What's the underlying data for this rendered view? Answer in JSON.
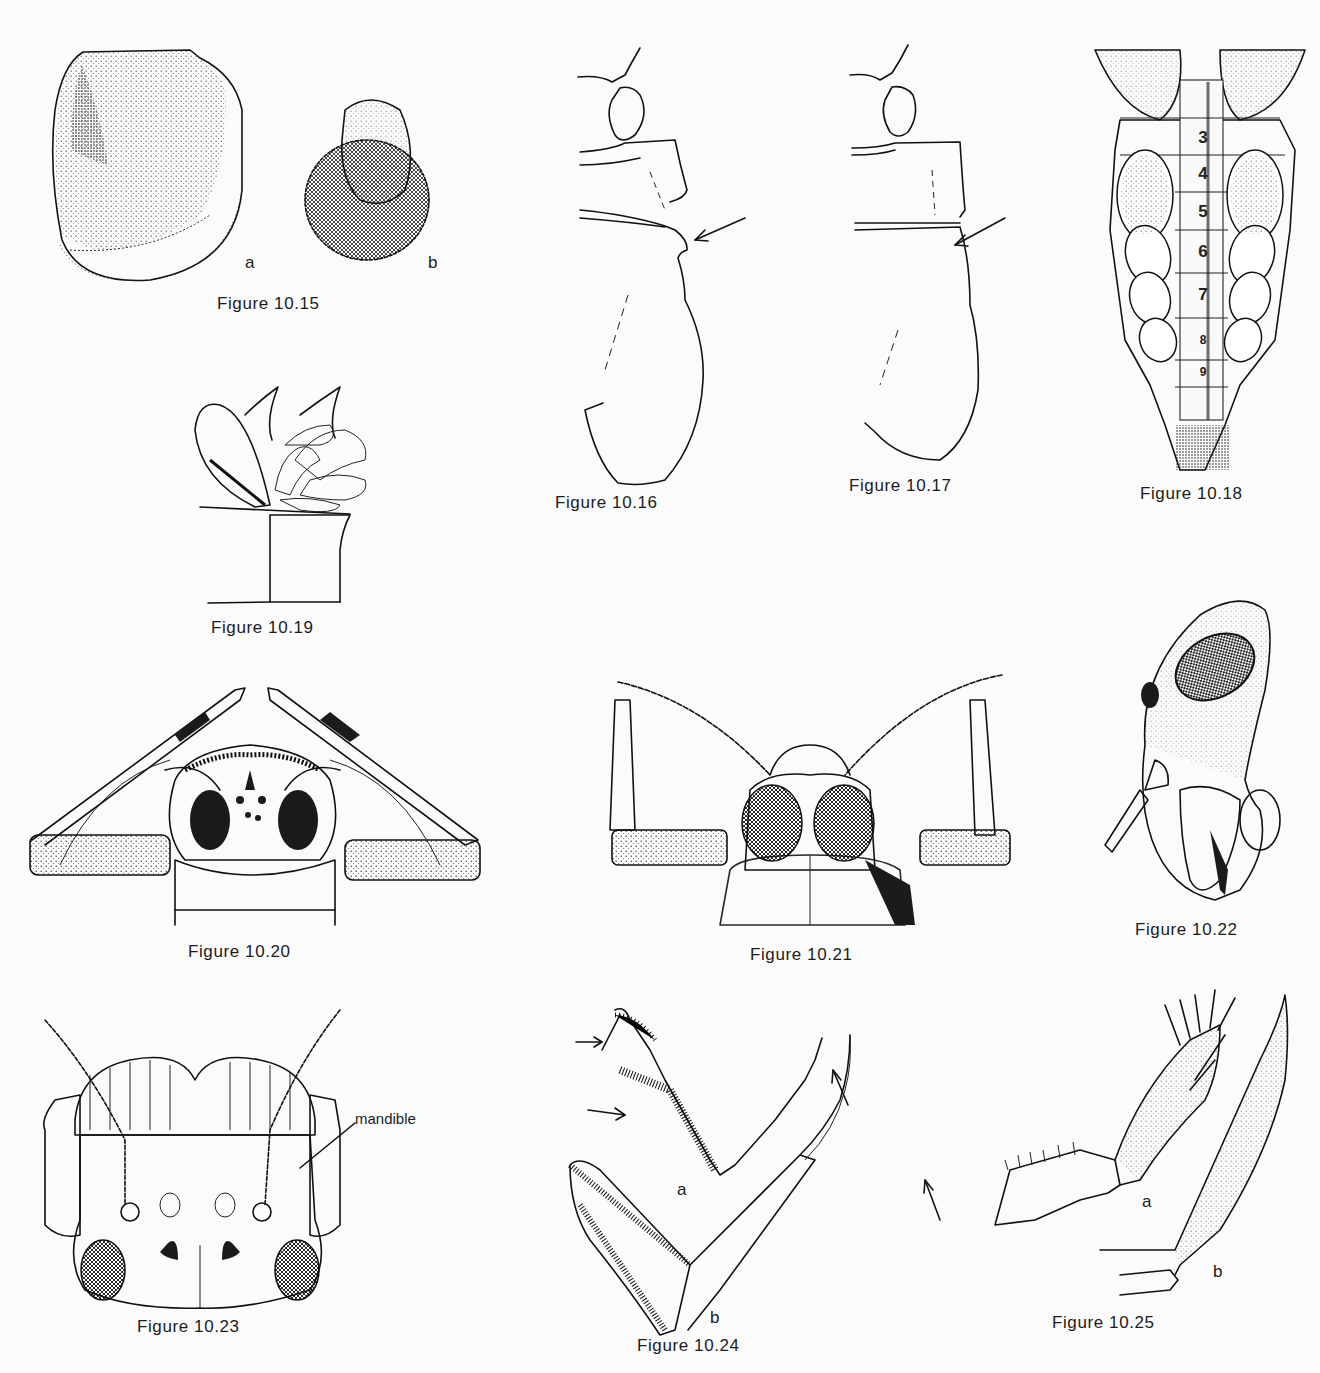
{
  "page": {
    "background": "#fbfbfb",
    "ink_color": "#111111"
  },
  "figures": {
    "f15": {
      "caption": "Figure 10.15",
      "labels": {
        "a": "a",
        "b": "b"
      },
      "subject": "shell-shaped case (a) and hairy rounded case (b)"
    },
    "f16": {
      "caption": "Figure 10.16",
      "subject": "lateral outline of thorax with notch",
      "arrow": "arrow pointing to notch"
    },
    "f17": {
      "caption": "Figure 10.17",
      "subject": "lateral outline of thorax without notch",
      "arrow": "arrow pointing to junction"
    },
    "f18": {
      "caption": "Figure 10.18",
      "subject": "abdomen dorsal view with gills",
      "segments": [
        "3",
        "4",
        "5",
        "6",
        "7",
        "8",
        "9"
      ]
    },
    "f19": {
      "caption": "Figure 10.19",
      "subject": "gill tuft on segment"
    },
    "f20": {
      "caption": "Figure 10.20",
      "subject": "head front view with raised forelegs"
    },
    "f21": {
      "caption": "Figure 10.21",
      "subject": "head dorsal view with large compound eyes"
    },
    "f22": {
      "caption": "Figure 10.22",
      "subject": "head lateral view"
    },
    "f23": {
      "caption": "Figure 10.23",
      "subject": "head dorsal view",
      "annotation": "mandible"
    },
    "f24": {
      "caption": "Figure 10.24",
      "labels": {
        "a": "a",
        "b": "b"
      },
      "subject": "legs with tarsal claws (a, b)"
    },
    "f25": {
      "caption": "Figure 10.25",
      "labels": {
        "a": "a",
        "b": "b"
      },
      "subject": "claw detail (a, b)"
    }
  }
}
